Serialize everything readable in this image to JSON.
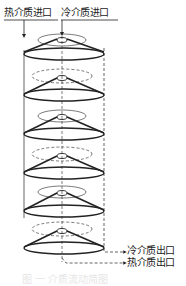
{
  "labels": {
    "hot_inlet": "热介质进口",
    "cold_inlet": "冷介质进口",
    "cold_outlet": "冷介质出口",
    "hot_outlet": "热介质出口"
  },
  "caption": "图  一  介质流动简图",
  "diagram": {
    "type": "stacked-cone-plate heat exchanger flow schematic",
    "plate_count": 6,
    "line_color": "#222222"
  }
}
